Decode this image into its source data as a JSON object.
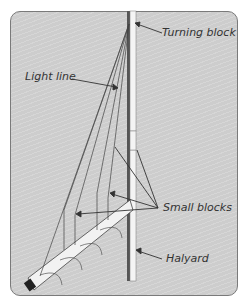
{
  "diagram": {
    "title": "",
    "labels": {
      "turning_block": "Turning block",
      "light_line": "Light line",
      "small_blocks": "Small blocks",
      "halyard": "Halyard"
    },
    "colors": {
      "panel_bg": "#cdcdcd",
      "panel_border": "#7a7a7a",
      "line": "#333333",
      "mast": "#555555",
      "sail": "#f4f4f4"
    }
  }
}
